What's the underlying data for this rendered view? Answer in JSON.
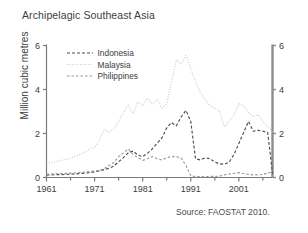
{
  "figure": {
    "title": "Archipelagic Southeast Asia",
    "source": "Source: FAOSTAT 2010.",
    "y_axis_label": "Million cubic metres"
  },
  "chart_data": {
    "type": "line",
    "title": "Archipelagic Southeast Asia",
    "xlabel": "",
    "ylabel": "Million cubic metres",
    "xlim": [
      1961,
      2008
    ],
    "ylim": [
      0,
      6
    ],
    "yticks": [
      0,
      2,
      4,
      6
    ],
    "xticks": [
      1961,
      1971,
      1981,
      1991,
      2001
    ],
    "xtick_labels": [
      "1961",
      "1971",
      "1981",
      "1991",
      "2001"
    ],
    "ytick_labels_left": [
      "0",
      "2",
      "4",
      "6"
    ],
    "ytick_labels_right": [
      "0",
      "2",
      "4",
      "6"
    ],
    "grid": false,
    "legend_position": "upper-left-inside",
    "minor_xtick_interval": 5,
    "colors": {
      "indonesia": "#4d4d4d",
      "malaysia": "#c9c9c9",
      "philippines": "#9a9a9a",
      "axis": "#7a7a7a",
      "right_axis": "#8c8c8c",
      "text": "#3d3d3d"
    },
    "series": [
      {
        "name": "Indonesia",
        "dash": "3,2",
        "color": "#4d4d4d",
        "x": [
          1961,
          1962,
          1963,
          1964,
          1965,
          1966,
          1967,
          1968,
          1969,
          1970,
          1971,
          1972,
          1973,
          1974,
          1975,
          1976,
          1977,
          1978,
          1979,
          1980,
          1981,
          1982,
          1983,
          1984,
          1985,
          1986,
          1987,
          1988,
          1989,
          1990,
          1991,
          1992,
          1993,
          1994,
          1995,
          1996,
          1997,
          1998,
          1999,
          2000,
          2001,
          2002,
          2003,
          2004,
          2005,
          2006,
          2007,
          2008
        ],
        "values": [
          0.12,
          0.12,
          0.13,
          0.13,
          0.14,
          0.15,
          0.16,
          0.18,
          0.2,
          0.22,
          0.26,
          0.3,
          0.36,
          0.42,
          0.52,
          0.72,
          0.9,
          1.12,
          1.2,
          1.02,
          0.95,
          1.1,
          1.3,
          1.55,
          1.8,
          2.25,
          2.5,
          2.35,
          2.75,
          3.05,
          2.55,
          0.85,
          0.8,
          0.9,
          0.85,
          0.7,
          0.62,
          0.6,
          0.7,
          1.05,
          1.55,
          2.05,
          2.55,
          2.1,
          2.15,
          2.1,
          2.05,
          0.18
        ]
      },
      {
        "name": "Malaysia",
        "dash": "1,1.6",
        "color": "#c9c9c9",
        "x": [
          1961,
          1962,
          1963,
          1964,
          1965,
          1966,
          1967,
          1968,
          1969,
          1970,
          1971,
          1972,
          1973,
          1974,
          1975,
          1976,
          1977,
          1978,
          1979,
          1980,
          1981,
          1982,
          1983,
          1984,
          1985,
          1986,
          1987,
          1988,
          1989,
          1990,
          1991,
          1992,
          1993,
          1994,
          1995,
          1996,
          1997,
          1998,
          1999,
          2000,
          2001,
          2002,
          2003,
          2004,
          2005,
          2006,
          2007,
          2008
        ],
        "values": [
          0.65,
          0.68,
          0.72,
          0.78,
          0.82,
          0.88,
          0.95,
          1.05,
          1.15,
          1.3,
          1.35,
          1.7,
          2.2,
          2.05,
          2.2,
          2.55,
          2.95,
          3.3,
          2.9,
          3.45,
          3.25,
          3.6,
          3.35,
          3.55,
          3.15,
          3.35,
          4.35,
          5.35,
          5.15,
          5.55,
          4.95,
          4.35,
          3.85,
          3.55,
          3.25,
          3.15,
          3.0,
          2.3,
          2.55,
          2.85,
          3.35,
          3.25,
          2.95,
          2.75,
          2.85,
          2.55,
          2.3,
          2.05
        ]
      },
      {
        "name": "Philippines",
        "dash": "2.5,2",
        "color": "#9a9a9a",
        "x": [
          1961,
          1962,
          1963,
          1964,
          1965,
          1966,
          1967,
          1968,
          1969,
          1970,
          1971,
          1972,
          1973,
          1974,
          1975,
          1976,
          1977,
          1978,
          1979,
          1980,
          1981,
          1982,
          1983,
          1984,
          1985,
          1986,
          1987,
          1988,
          1989,
          1990,
          1991,
          1992,
          1993,
          1994,
          1995,
          1996,
          1997,
          1998,
          1999,
          2000,
          2001,
          2002,
          2003,
          2004,
          2005,
          2006,
          2007,
          2008
        ],
        "values": [
          0.15,
          0.16,
          0.17,
          0.18,
          0.19,
          0.2,
          0.21,
          0.23,
          0.25,
          0.27,
          0.3,
          0.32,
          0.4,
          0.55,
          0.68,
          0.95,
          1.12,
          1.3,
          1.05,
          0.9,
          0.78,
          0.85,
          0.95,
          0.85,
          0.8,
          0.9,
          0.95,
          0.95,
          0.88,
          0.55,
          0.08,
          0.04,
          0.04,
          0.04,
          0.05,
          0.05,
          0.06,
          0.12,
          0.16,
          0.18,
          0.22,
          0.18,
          0.14,
          0.12,
          0.12,
          0.14,
          0.2,
          0.26
        ]
      }
    ],
    "legend": [
      {
        "label": "Indonesia",
        "color": "#4d4d4d",
        "dash": "3,2"
      },
      {
        "label": "Malaysia",
        "color": "#c9c9c9",
        "dash": "1,1.6"
      },
      {
        "label": "Philippines",
        "color": "#9a9a9a",
        "dash": "2.5,2"
      }
    ]
  }
}
